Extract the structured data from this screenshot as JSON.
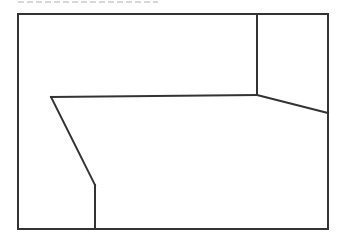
{
  "diagram": {
    "title": "",
    "caption_clipped": true,
    "stroke_color": "#333333",
    "stroke_width": 2,
    "background": "#ffffff",
    "frame": {
      "x": 18,
      "y": 14,
      "width": 310,
      "height": 215
    },
    "segments": [
      {
        "name": "top-right-vertical",
        "x1": 257,
        "y1": 14,
        "x2": 257,
        "y2": 95
      },
      {
        "name": "horizontal-edge",
        "x1": 51,
        "y1": 97,
        "x2": 257,
        "y2": 95
      },
      {
        "name": "right-slant",
        "x1": 257,
        "y1": 95,
        "x2": 328,
        "y2": 113
      },
      {
        "name": "left-slant",
        "x1": 51,
        "y1": 97,
        "x2": 95,
        "y2": 185
      },
      {
        "name": "bottom-vertical",
        "x1": 95,
        "y1": 185,
        "x2": 95,
        "y2": 229
      }
    ]
  }
}
